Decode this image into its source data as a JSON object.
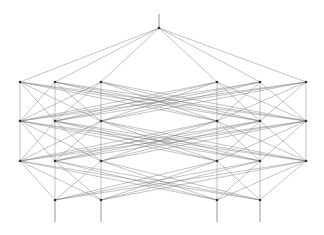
{
  "diagram": {
    "type": "layered-network",
    "colors": {
      "edge": "#7a7a7a",
      "node": "#333333",
      "background": "#ffffff"
    },
    "layers": [
      {
        "name": "top",
        "y": 28,
        "nodes": [
          159
        ]
      },
      {
        "name": "layer-1",
        "y": 82,
        "nodes": [
          20,
          55,
          101,
          217,
          260,
          306
        ]
      },
      {
        "name": "layer-2",
        "y": 121,
        "nodes": [
          20,
          55,
          101,
          217,
          260,
          306
        ]
      },
      {
        "name": "layer-3",
        "y": 161,
        "nodes": [
          20,
          55,
          101,
          217,
          260,
          306
        ]
      },
      {
        "name": "bottom",
        "y": 200,
        "nodes": [
          55,
          101,
          217,
          260
        ]
      }
    ],
    "stems": [
      {
        "x": 159,
        "y1": 14,
        "y2": 28
      },
      {
        "x": 55,
        "y1": 200,
        "y2": 222
      },
      {
        "x": 101,
        "y1": 200,
        "y2": 222
      },
      {
        "x": 217,
        "y1": 200,
        "y2": 222
      },
      {
        "x": 260,
        "y1": 200,
        "y2": 222
      }
    ]
  }
}
